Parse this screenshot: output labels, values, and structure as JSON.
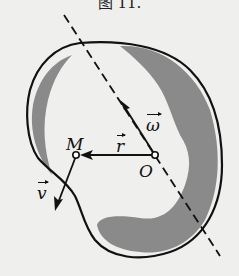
{
  "figure": {
    "caption": "图 11.",
    "labels": {
      "point_M": "M",
      "point_O": "O",
      "vector_r": "r",
      "vector_omega": "ω",
      "vector_v": "v"
    },
    "colors": {
      "outline": "#111111",
      "shade": "#8a8a8a",
      "background": "#efefed"
    }
  }
}
